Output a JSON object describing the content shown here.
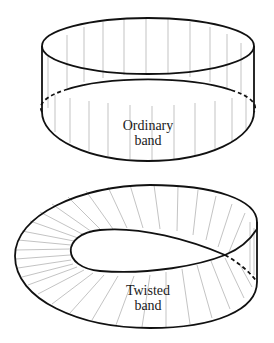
{
  "figures": [
    {
      "id": "ordinary",
      "label_line1": "Ordinary",
      "label_line2": "band"
    },
    {
      "id": "twisted",
      "label_line1": "Twisted",
      "label_line2": "band"
    }
  ],
  "colors": {
    "stroke": "#111111",
    "ruling": "#9a9a9a",
    "background": "#ffffff"
  }
}
